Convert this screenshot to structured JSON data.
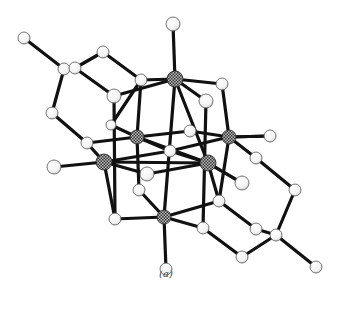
{
  "figure": {
    "caption": "(a)",
    "colors": {
      "bond": "#111111",
      "atom_fill": "#f4f4f4",
      "atom_stroke": "#555555",
      "metal_fill_a": "#444444",
      "metal_fill_b": "#bbbbbb"
    }
  },
  "atoms": [
    {
      "id": "M1",
      "type": "metal",
      "x": 175,
      "y": 79,
      "r": 8
    },
    {
      "id": "M2",
      "type": "metal",
      "x": 137,
      "y": 137,
      "r": 7
    },
    {
      "id": "M3",
      "type": "metal",
      "x": 229,
      "y": 137,
      "r": 7
    },
    {
      "id": "M4",
      "type": "metal",
      "x": 104,
      "y": 162,
      "r": 8
    },
    {
      "id": "M5",
      "type": "metal",
      "x": 208,
      "y": 163,
      "r": 8
    },
    {
      "id": "M6",
      "type": "metal",
      "x": 164,
      "y": 217,
      "r": 7
    },
    {
      "id": "T1",
      "type": "atom",
      "x": 173,
      "y": 24,
      "r": 7
    },
    {
      "id": "T2",
      "type": "atom",
      "x": 24,
      "y": 38,
      "r": 6
    },
    {
      "id": "A1",
      "type": "atom",
      "x": 64,
      "y": 69,
      "r": 6
    },
    {
      "id": "A2",
      "type": "atom",
      "x": 75,
      "y": 68,
      "r": 6
    },
    {
      "id": "A3",
      "type": "atom",
      "x": 103,
      "y": 52,
      "r": 6
    },
    {
      "id": "A4",
      "type": "atom",
      "x": 141,
      "y": 80,
      "r": 6
    },
    {
      "id": "A5",
      "type": "atom",
      "x": 114,
      "y": 96,
      "r": 7
    },
    {
      "id": "A6",
      "type": "atom",
      "x": 222,
      "y": 84,
      "r": 6
    },
    {
      "id": "A7",
      "type": "atom",
      "x": 206,
      "y": 101,
      "r": 7
    },
    {
      "id": "A8",
      "type": "atom",
      "x": 52,
      "y": 113,
      "r": 6
    },
    {
      "id": "A9",
      "type": "atom",
      "x": 87,
      "y": 143,
      "r": 6
    },
    {
      "id": "A10",
      "type": "atom",
      "x": 111,
      "y": 125,
      "r": 5
    },
    {
      "id": "A11",
      "type": "atom",
      "x": 190,
      "y": 131,
      "r": 6
    },
    {
      "id": "A12",
      "type": "atom",
      "x": 170,
      "y": 151,
      "r": 6
    },
    {
      "id": "A13",
      "type": "atom",
      "x": 270,
      "y": 136,
      "r": 6
    },
    {
      "id": "A14",
      "type": "atom",
      "x": 256,
      "y": 158,
      "r": 6
    },
    {
      "id": "A15",
      "type": "atom",
      "x": 54,
      "y": 167,
      "r": 7
    },
    {
      "id": "A16",
      "type": "atom",
      "x": 147,
      "y": 174,
      "r": 7
    },
    {
      "id": "A17",
      "type": "atom",
      "x": 242,
      "y": 183,
      "r": 7
    },
    {
      "id": "A18",
      "type": "atom",
      "x": 139,
      "y": 190,
      "r": 6
    },
    {
      "id": "A19",
      "type": "atom",
      "x": 219,
      "y": 201,
      "r": 6
    },
    {
      "id": "A20",
      "type": "atom",
      "x": 295,
      "y": 190,
      "r": 6
    },
    {
      "id": "A21",
      "type": "atom",
      "x": 115,
      "y": 219,
      "r": 6
    },
    {
      "id": "A22",
      "type": "atom",
      "x": 203,
      "y": 228,
      "r": 6
    },
    {
      "id": "A23",
      "type": "atom",
      "x": 256,
      "y": 229,
      "r": 6
    },
    {
      "id": "A24",
      "type": "atom",
      "x": 276,
      "y": 235,
      "r": 6
    },
    {
      "id": "A25",
      "type": "atom",
      "x": 242,
      "y": 257,
      "r": 6
    },
    {
      "id": "A26",
      "type": "atom",
      "x": 316,
      "y": 267,
      "r": 6
    },
    {
      "id": "A27",
      "type": "atom",
      "x": 166,
      "y": 269,
      "r": 6
    }
  ],
  "bonds": [
    [
      "T1",
      "M1"
    ],
    [
      "M1",
      "A4"
    ],
    [
      "M1",
      "A5"
    ],
    [
      "M1",
      "A6"
    ],
    [
      "M1",
      "A7"
    ],
    [
      "T2",
      "A1"
    ],
    [
      "A1",
      "A2"
    ],
    [
      "A2",
      "A3"
    ],
    [
      "A3",
      "A4"
    ],
    [
      "A2",
      "A5"
    ],
    [
      "A1",
      "A8"
    ],
    [
      "A8",
      "A9"
    ],
    [
      "A9",
      "M2"
    ],
    [
      "A9",
      "M4"
    ],
    [
      "A4",
      "A10"
    ],
    [
      "A5",
      "A21"
    ],
    [
      "A10",
      "M2"
    ],
    [
      "M1",
      "M5"
    ],
    [
      "A6",
      "M3"
    ],
    [
      "A7",
      "A22"
    ],
    [
      "M2",
      "A11"
    ],
    [
      "A11",
      "M3"
    ],
    [
      "M2",
      "A12"
    ],
    [
      "M2",
      "M5"
    ],
    [
      "M3",
      "A13"
    ],
    [
      "M3",
      "A14"
    ],
    [
      "M3",
      "A19"
    ],
    [
      "M4",
      "A12"
    ],
    [
      "A12",
      "M3"
    ],
    [
      "M4",
      "A15"
    ],
    [
      "M4",
      "A16"
    ],
    [
      "M4",
      "M5"
    ],
    [
      "A16",
      "M5"
    ],
    [
      "M5",
      "A17"
    ],
    [
      "M5",
      "A12"
    ],
    [
      "M5",
      "A19"
    ],
    [
      "A18",
      "M6"
    ],
    [
      "A21",
      "M6"
    ],
    [
      "M6",
      "A19"
    ],
    [
      "M6",
      "A22"
    ],
    [
      "M6",
      "A27"
    ],
    [
      "M1",
      "M6"
    ],
    [
      "M4",
      "A21"
    ],
    [
      "M2",
      "A18"
    ],
    [
      "A14",
      "A20"
    ],
    [
      "A20",
      "A24"
    ],
    [
      "A24",
      "A26"
    ],
    [
      "A24",
      "A23"
    ],
    [
      "A19",
      "A23"
    ],
    [
      "A22",
      "A25"
    ],
    [
      "A25",
      "A24"
    ],
    [
      "A4",
      "M2"
    ],
    [
      "A13",
      "M3"
    ]
  ]
}
